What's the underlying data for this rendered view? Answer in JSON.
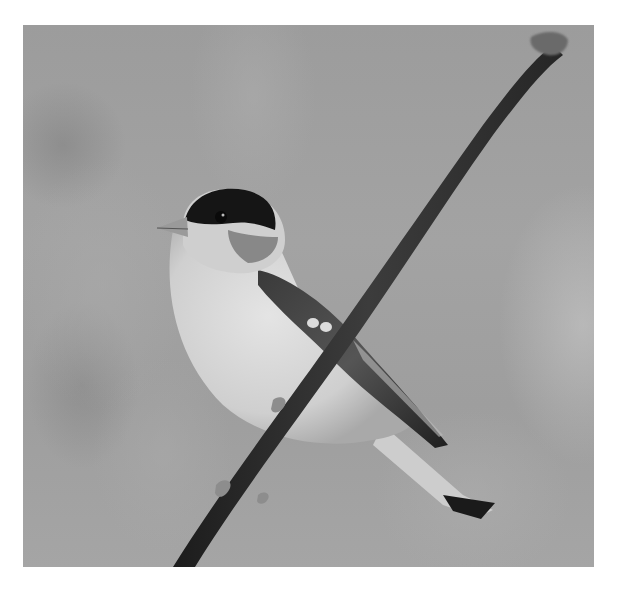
{
  "image": {
    "alt": "Grayscale photograph of a small finch with a dark cap perched on a thin diagonal branch against a blurred background",
    "subject": "bird",
    "perch": "branch",
    "style": "grayscale",
    "colors": {
      "border": "#ffffff",
      "background_gray": "#a0a0a0",
      "cap_dark": "#151515",
      "breast_light": "#d9d9d9",
      "branch_dark": "#2a2a2a"
    }
  }
}
